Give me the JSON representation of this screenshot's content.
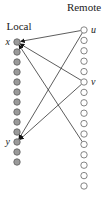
{
  "diagram": {
    "columns": {
      "local": {
        "label": "Local",
        "x": 17,
        "y_start": 42,
        "step": 10,
        "count": 13,
        "fill": "#9a9a9a"
      },
      "remote": {
        "label": "Remote",
        "x": 84,
        "y_start": 30,
        "step": 10.4,
        "count": 16,
        "fill": "#ffffff"
      }
    },
    "named_nodes": [
      {
        "id": "x",
        "label": "x",
        "column": "local",
        "index": 0
      },
      {
        "id": "y",
        "label": "y",
        "column": "local",
        "index": 10
      },
      {
        "id": "u",
        "label": "u",
        "column": "remote",
        "index": 0
      },
      {
        "id": "v",
        "label": "v",
        "column": "remote",
        "index": 5
      }
    ],
    "edges": [
      {
        "from": {
          "column": "remote",
          "index": 0
        },
        "to": {
          "column": "local",
          "index": 0
        }
      },
      {
        "from": {
          "column": "remote",
          "index": 5
        },
        "to": {
          "column": "local",
          "index": 0
        }
      },
      {
        "from": {
          "column": "remote",
          "index": 11
        },
        "to": {
          "column": "local",
          "index": 0
        }
      },
      {
        "from": {
          "column": "remote",
          "index": 0
        },
        "to": {
          "column": "local",
          "index": 10
        }
      },
      {
        "from": {
          "column": "remote",
          "index": 5
        },
        "to": {
          "column": "local",
          "index": 10
        }
      }
    ]
  }
}
